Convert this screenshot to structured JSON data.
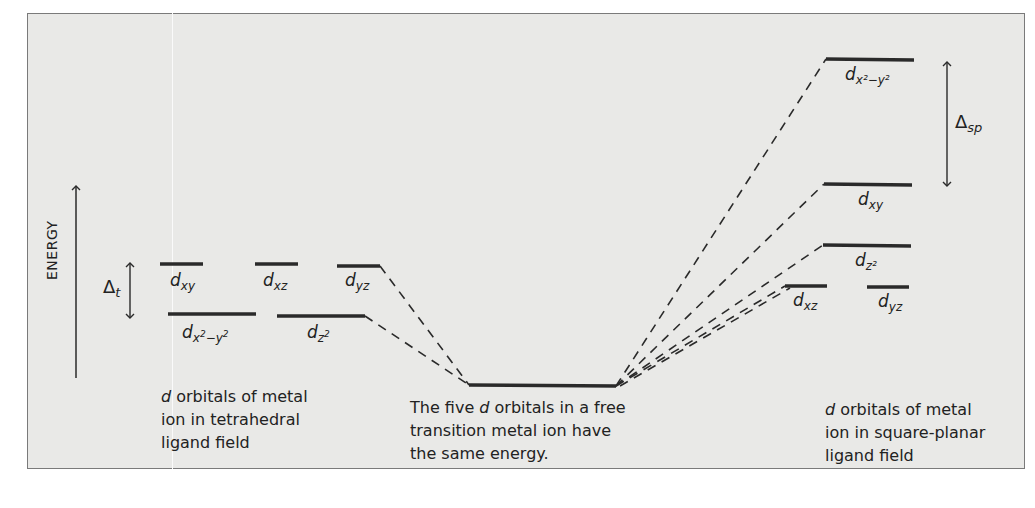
{
  "axis": {
    "energy_label": "ENERGY"
  },
  "tetrahedral": {
    "splitting_label": "Δ",
    "splitting_sub": "t",
    "upper_levels": [
      {
        "label": "d",
        "sub": "xy"
      },
      {
        "label": "d",
        "sub": "xz"
      },
      {
        "label": "d",
        "sub": "yz"
      }
    ],
    "lower_levels": [
      {
        "label": "d",
        "sub": "x",
        "sub_sup1": "2",
        "sub_mid": "−y",
        "sub_sup2": "2"
      },
      {
        "label": "d",
        "sub": "z",
        "sub_sup": "2"
      }
    ],
    "caption_lines": [
      "d orbitals of metal",
      "ion in tetrahedral",
      "ligand field"
    ],
    "caption_italic_word": "d"
  },
  "free_ion": {
    "caption_lines": [
      "The five d orbitals in a free",
      "transition metal ion have",
      "the same energy."
    ]
  },
  "square_planar": {
    "splitting_label": "Δ",
    "splitting_sub": "sp",
    "levels": [
      {
        "label": "d",
        "sub": "x²−y²"
      },
      {
        "label": "d",
        "sub": "xy"
      },
      {
        "label": "d",
        "sub": "z²"
      },
      {
        "label": "d",
        "sub": "xz"
      },
      {
        "label": "d",
        "sub": "yz"
      }
    ],
    "caption_lines": [
      "d orbitals of metal",
      "ion in square-planar",
      "ligand field"
    ]
  },
  "colors": {
    "panel_bg": "#e9e9e7",
    "line": "#2a2a2a",
    "border": "#7a7a7a"
  }
}
